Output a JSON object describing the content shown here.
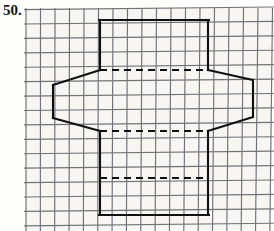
{
  "page": {
    "width": 274,
    "height": 231,
    "background_color": "#fdfdfb",
    "paper_tint_color": "#f7f6f2"
  },
  "problem": {
    "number_label": "50.",
    "kind": "geometry-figure-on-graph-paper"
  },
  "grid": {
    "line_color": "#6f7378",
    "cell_size_px": 14.4,
    "x_start": 26,
    "y_start": 8,
    "columns": 17,
    "rows": 16,
    "slightly_skewed": true
  },
  "figure": {
    "stroke_color": "#101010",
    "stroke_width": 2.1,
    "dash_pattern": "7 5",
    "rectangle": {
      "name": "vertical-rectangle",
      "left": 100,
      "right": 208,
      "top": 20,
      "bottom": 215,
      "solid_edges": [
        "top",
        "left-upper",
        "left-lower",
        "right-upper",
        "right-lower",
        "bottom"
      ]
    },
    "hexagon": {
      "name": "horizontal-hexagon",
      "vertices": [
        {
          "label": "left-top",
          "x": 53,
          "y": 85
        },
        {
          "label": "upper-left-bend",
          "x": 100,
          "y": 70
        },
        {
          "label": "upper-right-bend",
          "x": 208,
          "y": 70
        },
        {
          "label": "right-top",
          "x": 253,
          "y": 80
        },
        {
          "label": "right-bottom",
          "x": 253,
          "y": 117
        },
        {
          "label": "lower-right-bend",
          "x": 208,
          "y": 131
        },
        {
          "label": "lower-left-bend",
          "x": 100,
          "y": 131
        },
        {
          "label": "left-bottom",
          "x": 53,
          "y": 118
        }
      ],
      "solid_edges": [
        "left-slant-upper",
        "left-vertical",
        "left-slant-lower",
        "right-slant-upper",
        "right-vertical",
        "right-slant-lower"
      ]
    },
    "dashed_segments": [
      {
        "name": "hexagon-top-hidden-edge",
        "x1": 100,
        "y1": 70,
        "x2": 208,
        "y2": 70
      },
      {
        "name": "hexagon-bottom-hidden-edge",
        "x1": 100,
        "y1": 131,
        "x2": 208,
        "y2": 131
      },
      {
        "name": "lower-fold-hidden-edge",
        "x1": 100,
        "y1": 178,
        "x2": 208,
        "y2": 178
      }
    ]
  }
}
